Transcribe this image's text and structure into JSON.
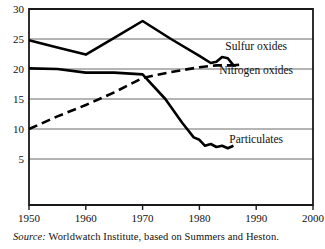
{
  "figure": {
    "source_prefix": "Source:",
    "source_text": " Worldwatch Institute, based on Summers and Heston."
  },
  "chart_data": {
    "type": "line",
    "title": "",
    "xlabel": "",
    "ylabel": "",
    "xlim": [
      1950,
      2000
    ],
    "ylim": [
      0,
      30
    ],
    "grid": "horizontal",
    "legend": "inline-right",
    "xticks": [
      1950,
      1960,
      1970,
      1980,
      1990,
      2000
    ],
    "xtick_labels": [
      "1950",
      "1960",
      "1970",
      "1980",
      "1990",
      "2000"
    ],
    "yticks": [
      5,
      10,
      15,
      20,
      25,
      30
    ],
    "ytick_labels": [
      "5",
      "10",
      "15",
      "20",
      "25",
      "30"
    ],
    "series": [
      {
        "name": "Sulfur oxides",
        "label": "Sulfur oxides",
        "style": "solid",
        "color": "#000000",
        "width": 2.6,
        "label_x": 1990,
        "label_y": 23.2,
        "x": [
          1950,
          1955,
          1960,
          1965,
          1970,
          1975,
          1980,
          1982,
          1983,
          1984,
          1985,
          1986,
          1987
        ],
        "y": [
          24.8,
          23.6,
          22.4,
          25.2,
          28.0,
          25.0,
          22.2,
          21.0,
          21.2,
          22.0,
          21.8,
          20.6,
          20.7
        ]
      },
      {
        "name": "Nitrogen oxides",
        "label": "Nitrogen oxides",
        "style": "dashed",
        "color": "#000000",
        "width": 2.6,
        "dash": "9,5",
        "label_x": 1990,
        "label_y": 19.2,
        "x": [
          1950,
          1955,
          1960,
          1965,
          1970,
          1975,
          1980,
          1983,
          1985,
          1987
        ],
        "y": [
          10.0,
          12.1,
          14.0,
          16.1,
          18.5,
          19.5,
          20.3,
          20.6,
          20.6,
          20.6
        ]
      },
      {
        "name": "Particulates",
        "label": "Particulates",
        "style": "solid",
        "color": "#000000",
        "width": 2.6,
        "label_x": 1990,
        "label_y": 7.6,
        "x": [
          1950,
          1955,
          1960,
          1965,
          1970,
          1974,
          1977,
          1979,
          1980,
          1981,
          1982,
          1983,
          1984,
          1985,
          1986
        ],
        "y": [
          20.1,
          20.0,
          19.4,
          19.4,
          19.1,
          15.0,
          11.0,
          8.6,
          8.2,
          7.2,
          7.5,
          7.0,
          7.2,
          6.8,
          7.2
        ]
      }
    ]
  }
}
